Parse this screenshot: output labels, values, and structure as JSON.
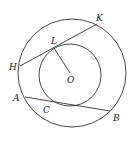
{
  "diagram": {
    "type": "concentric-circles-geometry",
    "stroke_color": "#333333",
    "outer_circle": {
      "cx": 72,
      "cy": 73,
      "r": 54
    },
    "inner_circle": {
      "cx": 70,
      "cy": 75,
      "r": 31
    },
    "segments": [
      {
        "name": "chord-HK",
        "from": "H",
        "to": "K"
      },
      {
        "name": "radius-LO",
        "from": "L",
        "to": "O"
      },
      {
        "name": "chord-AB",
        "from": "A",
        "to": "B"
      }
    ],
    "points": {
      "H": {
        "x": 20,
        "y": 66
      },
      "K": {
        "x": 97,
        "y": 24
      },
      "L": {
        "x": 54,
        "y": 48
      },
      "O": {
        "x": 70,
        "y": 73
      },
      "A": {
        "x": 25,
        "y": 97
      },
      "B": {
        "x": 110,
        "y": 111
      },
      "C": {
        "x": 68,
        "y": 104
      }
    },
    "labels": {
      "H": "H",
      "K": "K",
      "L": "L",
      "O": "O",
      "A": "A",
      "B": "B",
      "C": "C"
    }
  }
}
